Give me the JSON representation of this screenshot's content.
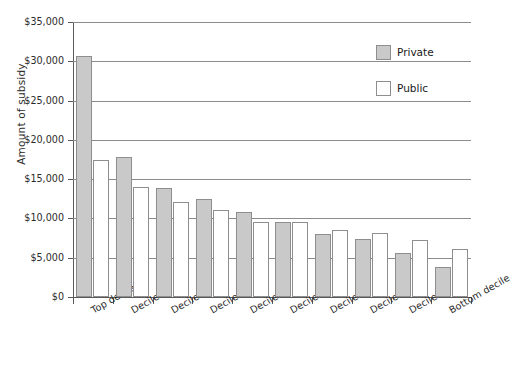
{
  "chart_data": {
    "type": "bar",
    "title": "",
    "xlabel": "",
    "ylabel": "Amount of subsidy",
    "ylim": [
      0,
      35000
    ],
    "ytick_labels": [
      "$35,000",
      "$30,000",
      "$25,000",
      "$20,000",
      "$15,000",
      "$10,000",
      "$5,000",
      "$0"
    ],
    "ytick_values": [
      35000,
      30000,
      25000,
      20000,
      15000,
      10000,
      5000,
      0
    ],
    "grid": true,
    "legend_position": "top-right",
    "categories": [
      "Top decile",
      "Decile 2",
      "Decile 3",
      "Decile 4",
      "Decile 5",
      "Decile 6",
      "Decile 7",
      "Decile 8",
      "Decile 9",
      "Bottom decile"
    ],
    "series": [
      {
        "name": "Private",
        "color": "#c9c9c9",
        "values": [
          30700,
          17800,
          13900,
          12500,
          10800,
          9500,
          8000,
          7400,
          5600,
          3800
        ]
      },
      {
        "name": "Public",
        "color": "#ffffff",
        "values": [
          17400,
          14000,
          12100,
          11100,
          9600,
          9500,
          8500,
          8200,
          7300,
          6100
        ]
      }
    ]
  },
  "legend": {
    "items": [
      {
        "label": "Private",
        "swatch": "private"
      },
      {
        "label": "Public",
        "swatch": "public"
      }
    ]
  }
}
